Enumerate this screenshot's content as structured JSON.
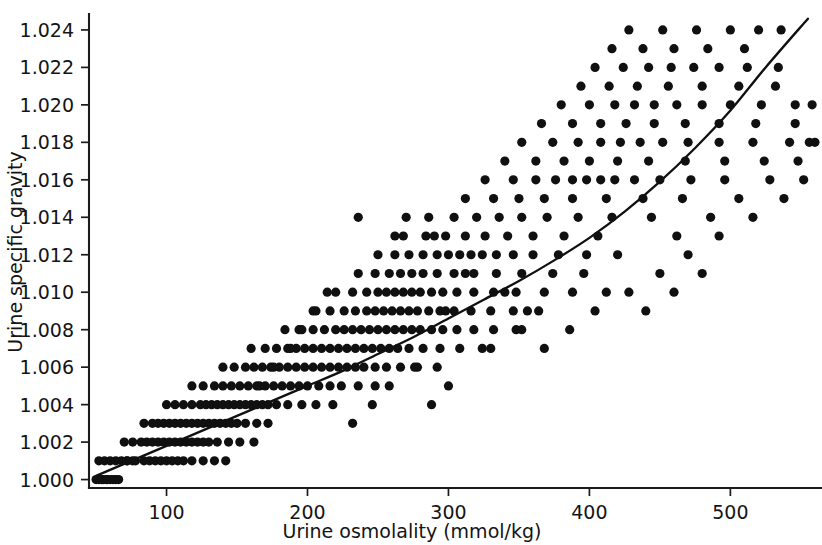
{
  "chart_data": {
    "type": "scatter",
    "title": "",
    "xlabel": "Urine osmolality (mmol/kg)",
    "ylabel": "Urine specific gravity",
    "xlim": [
      45,
      565
    ],
    "ylim": [
      0.99955,
      1.02485
    ],
    "xticks": [
      100,
      200,
      300,
      400,
      500
    ],
    "xtick_labels": [
      "100",
      "200",
      "300",
      "400",
      "500"
    ],
    "yticks": [
      1.0,
      1.002,
      1.004,
      1.006,
      1.008,
      1.01,
      1.012,
      1.014,
      1.016,
      1.018,
      1.02,
      1.022,
      1.024
    ],
    "ytick_labels": [
      "1.000",
      "1.002",
      "1.004",
      "1.006",
      "1.008",
      "1.010",
      "1.012",
      "1.014",
      "1.016",
      "1.018",
      "1.020",
      "1.022",
      "1.024"
    ],
    "grid": false,
    "legend": null,
    "marker": "filled-circle",
    "marker_color": "#101010",
    "marker_size_px": 4.6,
    "fit_curve": {
      "label": "fitted regression curve",
      "color": "#101010",
      "x": [
        50,
        75,
        100,
        125,
        150,
        175,
        200,
        225,
        250,
        275,
        300,
        325,
        350,
        375,
        400,
        425,
        450,
        475,
        500,
        525,
        555
      ],
      "y": [
        1.0002,
        1.001,
        1.0018,
        1.0026,
        1.0034,
        1.0042,
        1.005,
        1.0058,
        1.0067,
        1.0076,
        1.0086,
        1.0096,
        1.0106,
        1.0117,
        1.0129,
        1.0143,
        1.0159,
        1.0177,
        1.0197,
        1.022,
        1.0246
      ]
    },
    "points": [
      [
        50,
        1.0
      ],
      [
        52,
        1.0
      ],
      [
        54,
        1.0
      ],
      [
        55,
        1.0
      ],
      [
        57,
        1.0
      ],
      [
        58,
        1.0
      ],
      [
        60,
        1.0
      ],
      [
        62,
        1.0
      ],
      [
        64,
        1.0
      ],
      [
        66,
        1.0
      ],
      [
        52,
        1.001
      ],
      [
        56,
        1.001
      ],
      [
        60,
        1.001
      ],
      [
        64,
        1.001
      ],
      [
        68,
        1.001
      ],
      [
        72,
        1.001
      ],
      [
        76,
        1.001
      ],
      [
        72,
        1.001
      ],
      [
        78,
        1.001
      ],
      [
        84,
        1.001
      ],
      [
        88,
        1.001
      ],
      [
        92,
        1.001
      ],
      [
        96,
        1.001
      ],
      [
        100,
        1.001
      ],
      [
        104,
        1.001
      ],
      [
        108,
        1.001
      ],
      [
        112,
        1.001
      ],
      [
        118,
        1.001
      ],
      [
        126,
        1.001
      ],
      [
        134,
        1.001
      ],
      [
        142,
        1.001
      ],
      [
        70,
        1.002
      ],
      [
        76,
        1.002
      ],
      [
        82,
        1.002
      ],
      [
        86,
        1.002
      ],
      [
        90,
        1.002
      ],
      [
        94,
        1.002
      ],
      [
        98,
        1.002
      ],
      [
        102,
        1.002
      ],
      [
        106,
        1.002
      ],
      [
        110,
        1.002
      ],
      [
        114,
        1.002
      ],
      [
        118,
        1.002
      ],
      [
        122,
        1.002
      ],
      [
        126,
        1.002
      ],
      [
        130,
        1.002
      ],
      [
        136,
        1.002
      ],
      [
        144,
        1.002
      ],
      [
        152,
        1.002
      ],
      [
        162,
        1.002
      ],
      [
        84,
        1.003
      ],
      [
        90,
        1.003
      ],
      [
        94,
        1.003
      ],
      [
        98,
        1.003
      ],
      [
        102,
        1.003
      ],
      [
        106,
        1.003
      ],
      [
        110,
        1.003
      ],
      [
        114,
        1.003
      ],
      [
        118,
        1.003
      ],
      [
        122,
        1.003
      ],
      [
        126,
        1.003
      ],
      [
        130,
        1.003
      ],
      [
        134,
        1.003
      ],
      [
        138,
        1.003
      ],
      [
        142,
        1.003
      ],
      [
        146,
        1.003
      ],
      [
        150,
        1.003
      ],
      [
        156,
        1.003
      ],
      [
        164,
        1.003
      ],
      [
        172,
        1.003
      ],
      [
        100,
        1.004
      ],
      [
        106,
        1.004
      ],
      [
        112,
        1.004
      ],
      [
        118,
        1.004
      ],
      [
        124,
        1.004
      ],
      [
        128,
        1.004
      ],
      [
        132,
        1.004
      ],
      [
        136,
        1.004
      ],
      [
        140,
        1.004
      ],
      [
        144,
        1.004
      ],
      [
        148,
        1.004
      ],
      [
        152,
        1.004
      ],
      [
        156,
        1.004
      ],
      [
        160,
        1.004
      ],
      [
        164,
        1.004
      ],
      [
        168,
        1.004
      ],
      [
        172,
        1.004
      ],
      [
        178,
        1.004
      ],
      [
        186,
        1.004
      ],
      [
        196,
        1.004
      ],
      [
        206,
        1.004
      ],
      [
        218,
        1.004
      ],
      [
        118,
        1.005
      ],
      [
        126,
        1.005
      ],
      [
        134,
        1.005
      ],
      [
        140,
        1.005
      ],
      [
        146,
        1.005
      ],
      [
        152,
        1.005
      ],
      [
        158,
        1.005
      ],
      [
        164,
        1.005
      ],
      [
        170,
        1.005
      ],
      [
        176,
        1.005
      ],
      [
        182,
        1.005
      ],
      [
        188,
        1.005
      ],
      [
        194,
        1.005
      ],
      [
        200,
        1.005
      ],
      [
        208,
        1.005
      ],
      [
        216,
        1.005
      ],
      [
        224,
        1.005
      ],
      [
        236,
        1.005
      ],
      [
        248,
        1.005
      ],
      [
        140,
        1.006
      ],
      [
        148,
        1.006
      ],
      [
        156,
        1.006
      ],
      [
        162,
        1.006
      ],
      [
        168,
        1.006
      ],
      [
        174,
        1.006
      ],
      [
        180,
        1.006
      ],
      [
        186,
        1.006
      ],
      [
        192,
        1.006
      ],
      [
        198,
        1.006
      ],
      [
        204,
        1.006
      ],
      [
        210,
        1.006
      ],
      [
        216,
        1.006
      ],
      [
        222,
        1.006
      ],
      [
        228,
        1.006
      ],
      [
        234,
        1.006
      ],
      [
        240,
        1.006
      ],
      [
        248,
        1.006
      ],
      [
        256,
        1.006
      ],
      [
        266,
        1.006
      ],
      [
        278,
        1.006
      ],
      [
        292,
        1.006
      ],
      [
        160,
        1.007
      ],
      [
        170,
        1.007
      ],
      [
        178,
        1.007
      ],
      [
        186,
        1.007
      ],
      [
        192,
        1.007
      ],
      [
        198,
        1.007
      ],
      [
        204,
        1.007
      ],
      [
        210,
        1.007
      ],
      [
        216,
        1.007
      ],
      [
        222,
        1.007
      ],
      [
        228,
        1.007
      ],
      [
        234,
        1.007
      ],
      [
        240,
        1.007
      ],
      [
        246,
        1.007
      ],
      [
        252,
        1.007
      ],
      [
        258,
        1.007
      ],
      [
        264,
        1.007
      ],
      [
        272,
        1.007
      ],
      [
        282,
        1.007
      ],
      [
        294,
        1.007
      ],
      [
        308,
        1.007
      ],
      [
        324,
        1.007
      ],
      [
        184,
        1.008
      ],
      [
        194,
        1.008
      ],
      [
        204,
        1.008
      ],
      [
        212,
        1.008
      ],
      [
        220,
        1.008
      ],
      [
        226,
        1.008
      ],
      [
        232,
        1.008
      ],
      [
        238,
        1.008
      ],
      [
        244,
        1.008
      ],
      [
        250,
        1.008
      ],
      [
        256,
        1.008
      ],
      [
        262,
        1.008
      ],
      [
        268,
        1.008
      ],
      [
        274,
        1.008
      ],
      [
        280,
        1.008
      ],
      [
        288,
        1.008
      ],
      [
        296,
        1.008
      ],
      [
        306,
        1.008
      ],
      [
        318,
        1.008
      ],
      [
        332,
        1.008
      ],
      [
        348,
        1.008
      ],
      [
        204,
        1.009
      ],
      [
        216,
        1.009
      ],
      [
        226,
        1.009
      ],
      [
        234,
        1.009
      ],
      [
        242,
        1.009
      ],
      [
        248,
        1.009
      ],
      [
        254,
        1.009
      ],
      [
        260,
        1.009
      ],
      [
        266,
        1.009
      ],
      [
        272,
        1.009
      ],
      [
        278,
        1.009
      ],
      [
        286,
        1.009
      ],
      [
        294,
        1.009
      ],
      [
        304,
        1.009
      ],
      [
        316,
        1.009
      ],
      [
        330,
        1.009
      ],
      [
        346,
        1.009
      ],
      [
        364,
        1.009
      ],
      [
        220,
        1.01
      ],
      [
        232,
        1.01
      ],
      [
        242,
        1.01
      ],
      [
        250,
        1.01
      ],
      [
        256,
        1.01
      ],
      [
        262,
        1.01
      ],
      [
        268,
        1.01
      ],
      [
        274,
        1.01
      ],
      [
        280,
        1.01
      ],
      [
        288,
        1.01
      ],
      [
        296,
        1.01
      ],
      [
        306,
        1.01
      ],
      [
        318,
        1.01
      ],
      [
        332,
        1.01
      ],
      [
        348,
        1.01
      ],
      [
        368,
        1.01
      ],
      [
        388,
        1.01
      ],
      [
        236,
        1.011
      ],
      [
        248,
        1.011
      ],
      [
        258,
        1.011
      ],
      [
        266,
        1.011
      ],
      [
        274,
        1.011
      ],
      [
        282,
        1.011
      ],
      [
        292,
        1.011
      ],
      [
        304,
        1.011
      ],
      [
        318,
        1.011
      ],
      [
        334,
        1.011
      ],
      [
        352,
        1.011
      ],
      [
        374,
        1.011
      ],
      [
        250,
        1.012
      ],
      [
        262,
        1.012
      ],
      [
        272,
        1.012
      ],
      [
        282,
        1.012
      ],
      [
        292,
        1.012
      ],
      [
        300,
        1.012
      ],
      [
        308,
        1.012
      ],
      [
        316,
        1.012
      ],
      [
        324,
        1.012
      ],
      [
        334,
        1.012
      ],
      [
        346,
        1.012
      ],
      [
        360,
        1.012
      ],
      [
        378,
        1.012
      ],
      [
        398,
        1.012
      ],
      [
        420,
        1.012
      ],
      [
        268,
        1.013
      ],
      [
        284,
        1.013
      ],
      [
        298,
        1.013
      ],
      [
        312,
        1.013
      ],
      [
        326,
        1.013
      ],
      [
        342,
        1.013
      ],
      [
        360,
        1.013
      ],
      [
        382,
        1.013
      ],
      [
        406,
        1.013
      ],
      [
        236,
        1.014
      ],
      [
        286,
        1.014
      ],
      [
        304,
        1.014
      ],
      [
        320,
        1.014
      ],
      [
        336,
        1.014
      ],
      [
        352,
        1.014
      ],
      [
        370,
        1.014
      ],
      [
        392,
        1.014
      ],
      [
        416,
        1.014
      ],
      [
        444,
        1.014
      ],
      [
        312,
        1.015
      ],
      [
        332,
        1.015
      ],
      [
        350,
        1.015
      ],
      [
        368,
        1.015
      ],
      [
        388,
        1.015
      ],
      [
        412,
        1.015
      ],
      [
        438,
        1.015
      ],
      [
        466,
        1.015
      ],
      [
        326,
        1.016
      ],
      [
        346,
        1.016
      ],
      [
        362,
        1.016
      ],
      [
        376,
        1.016
      ],
      [
        388,
        1.016
      ],
      [
        398,
        1.016
      ],
      [
        408,
        1.016
      ],
      [
        418,
        1.016
      ],
      [
        432,
        1.016
      ],
      [
        450,
        1.016
      ],
      [
        472,
        1.016
      ],
      [
        496,
        1.016
      ],
      [
        340,
        1.017
      ],
      [
        362,
        1.017
      ],
      [
        382,
        1.017
      ],
      [
        400,
        1.017
      ],
      [
        420,
        1.017
      ],
      [
        442,
        1.017
      ],
      [
        468,
        1.017
      ],
      [
        496,
        1.017
      ],
      [
        524,
        1.017
      ],
      [
        352,
        1.018
      ],
      [
        374,
        1.018
      ],
      [
        392,
        1.018
      ],
      [
        408,
        1.018
      ],
      [
        422,
        1.018
      ],
      [
        436,
        1.018
      ],
      [
        452,
        1.018
      ],
      [
        470,
        1.018
      ],
      [
        492,
        1.018
      ],
      [
        516,
        1.018
      ],
      [
        542,
        1.018
      ],
      [
        556,
        1.018
      ],
      [
        560,
        1.018
      ],
      [
        366,
        1.019
      ],
      [
        388,
        1.019
      ],
      [
        408,
        1.019
      ],
      [
        426,
        1.019
      ],
      [
        446,
        1.019
      ],
      [
        468,
        1.019
      ],
      [
        492,
        1.019
      ],
      [
        518,
        1.019
      ],
      [
        546,
        1.019
      ],
      [
        380,
        1.02
      ],
      [
        400,
        1.02
      ],
      [
        418,
        1.02
      ],
      [
        432,
        1.02
      ],
      [
        446,
        1.02
      ],
      [
        462,
        1.02
      ],
      [
        480,
        1.02
      ],
      [
        500,
        1.02
      ],
      [
        522,
        1.02
      ],
      [
        546,
        1.02
      ],
      [
        558,
        1.02
      ],
      [
        394,
        1.021
      ],
      [
        414,
        1.021
      ],
      [
        434,
        1.021
      ],
      [
        456,
        1.021
      ],
      [
        480,
        1.021
      ],
      [
        506,
        1.021
      ],
      [
        532,
        1.021
      ],
      [
        404,
        1.022
      ],
      [
        424,
        1.022
      ],
      [
        442,
        1.022
      ],
      [
        458,
        1.022
      ],
      [
        474,
        1.022
      ],
      [
        492,
        1.022
      ],
      [
        512,
        1.022
      ],
      [
        534,
        1.022
      ],
      [
        416,
        1.023
      ],
      [
        438,
        1.023
      ],
      [
        460,
        1.023
      ],
      [
        484,
        1.023
      ],
      [
        510,
        1.023
      ],
      [
        428,
        1.024
      ],
      [
        452,
        1.024
      ],
      [
        476,
        1.024
      ],
      [
        500,
        1.024
      ],
      [
        520,
        1.024
      ],
      [
        536,
        1.024
      ],
      [
        312,
        1.011
      ],
      [
        298,
        1.009
      ],
      [
        340,
        1.01
      ],
      [
        356,
        1.009
      ],
      [
        290,
        1.013
      ],
      [
        270,
        1.014
      ],
      [
        262,
        1.013
      ],
      [
        206,
        1.009
      ],
      [
        214,
        1.01
      ],
      [
        196,
        1.008
      ],
      [
        188,
        1.007
      ],
      [
        176,
        1.006
      ],
      [
        166,
        1.005
      ],
      [
        246,
        1.004
      ],
      [
        232,
        1.003
      ],
      [
        258,
        1.005
      ],
      [
        276,
        1.006
      ],
      [
        300,
        1.005
      ],
      [
        288,
        1.004
      ],
      [
        330,
        1.007
      ],
      [
        352,
        1.008
      ],
      [
        368,
        1.007
      ],
      [
        386,
        1.008
      ],
      [
        404,
        1.009
      ],
      [
        428,
        1.01
      ],
      [
        450,
        1.011
      ],
      [
        470,
        1.012
      ],
      [
        492,
        1.013
      ],
      [
        516,
        1.014
      ],
      [
        538,
        1.015
      ],
      [
        552,
        1.016
      ],
      [
        462,
        1.013
      ],
      [
        486,
        1.014
      ],
      [
        506,
        1.015
      ],
      [
        528,
        1.016
      ],
      [
        548,
        1.017
      ],
      [
        396,
        1.011
      ],
      [
        412,
        1.01
      ],
      [
        440,
        1.009
      ],
      [
        460,
        1.01
      ],
      [
        480,
        1.011
      ]
    ]
  }
}
